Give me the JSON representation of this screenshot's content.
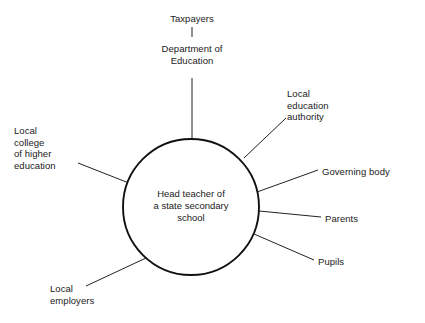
{
  "diagram": {
    "type": "hub-and-spoke stakeholder map",
    "canvas": {
      "width": 425,
      "height": 323,
      "background": "#ffffff"
    },
    "style": {
      "line_color": "#222222",
      "circle_stroke": "#111111",
      "text_color": "#1a1a1a"
    },
    "hub": {
      "label": "Head teacher of\na state secondary\nschool",
      "cx": 191,
      "cy": 207,
      "r": 68
    },
    "nodes": [
      {
        "id": "taxpayers",
        "label": "Taxpayers",
        "align": "center",
        "x": 155,
        "y": 13,
        "width": 74
      },
      {
        "id": "department-of-education",
        "label": "Department of\nEducation",
        "align": "center",
        "x": 142,
        "y": 43,
        "width": 100
      },
      {
        "id": "local-education-authority",
        "label": "Local\neducation\nauthority",
        "align": "left",
        "x": 287,
        "y": 88,
        "width": 78
      },
      {
        "id": "governing-body",
        "label": "Governing body",
        "align": "left",
        "x": 322,
        "y": 166,
        "width": 98
      },
      {
        "id": "parents",
        "label": "Parents",
        "align": "left",
        "x": 325,
        "y": 213,
        "width": 60
      },
      {
        "id": "pupils",
        "label": "Pupils",
        "align": "left",
        "x": 318,
        "y": 256,
        "width": 56
      },
      {
        "id": "local-employers",
        "label": "Local\nemployers",
        "align": "left",
        "x": 50,
        "y": 283,
        "width": 72
      },
      {
        "id": "local-college-of-higher-education",
        "label": "Local\ncollege\nof higher\neducation",
        "align": "left",
        "x": 14,
        "y": 125,
        "width": 72
      }
    ],
    "connectors": [
      {
        "id": "taxpayers-to-department",
        "x1": 192,
        "y1": 27,
        "x2": 192,
        "y2": 37
      },
      {
        "id": "department-to-hub",
        "x1": 192,
        "y1": 78,
        "x2": 192,
        "y2": 139
      },
      {
        "id": "lea-to-hub",
        "x1": 286,
        "y1": 118,
        "x2": 244,
        "y2": 158
      },
      {
        "id": "governing-body-to-hub",
        "x1": 318,
        "y1": 170,
        "x2": 257,
        "y2": 192
      },
      {
        "id": "parents-to-hub",
        "x1": 321,
        "y1": 217,
        "x2": 259,
        "y2": 211
      },
      {
        "id": "pupils-to-hub",
        "x1": 314,
        "y1": 260,
        "x2": 254,
        "y2": 234
      },
      {
        "id": "employers-to-hub",
        "x1": 86,
        "y1": 286,
        "x2": 146,
        "y2": 258
      },
      {
        "id": "college-to-hub",
        "x1": 78,
        "y1": 163,
        "x2": 134,
        "y2": 185
      }
    ]
  }
}
